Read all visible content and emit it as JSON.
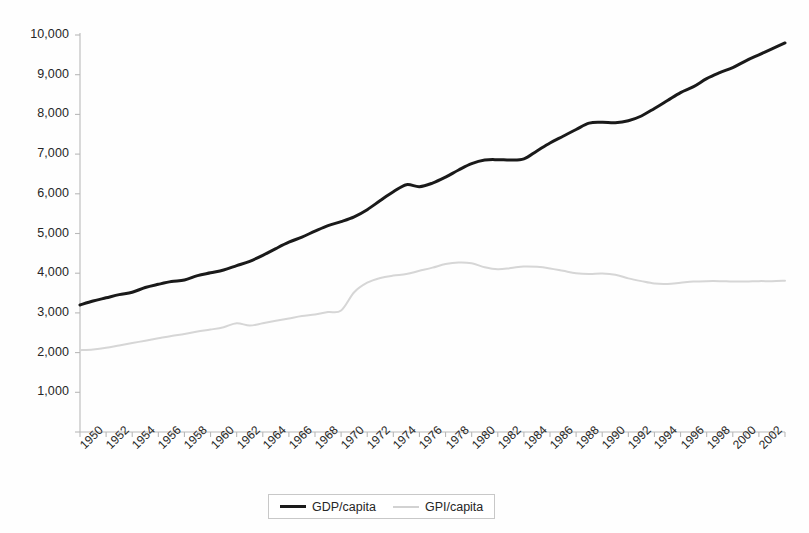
{
  "chart_data": {
    "type": "line",
    "title": "",
    "subtitle": "",
    "xlabel": "",
    "ylabel": "",
    "grid": false,
    "legend_position": "bottom",
    "xlim": [
      1950,
      2004
    ],
    "ylim": [
      0,
      10000
    ],
    "y_ticks": [
      1000,
      2000,
      3000,
      4000,
      5000,
      6000,
      7000,
      8000,
      9000,
      10000
    ],
    "y_tick_labels": [
      "1,000",
      "2,000",
      "3,000",
      "4,000",
      "5,000",
      "6,000",
      "7,000",
      "8,000",
      "9,000",
      "10,000"
    ],
    "x_ticks": [
      1950,
      1952,
      1954,
      1956,
      1958,
      1960,
      1962,
      1964,
      1966,
      1968,
      1970,
      1972,
      1974,
      1976,
      1978,
      1980,
      1982,
      1984,
      1986,
      1988,
      1990,
      1992,
      1994,
      1996,
      1998,
      2000,
      2002
    ],
    "x_tick_labels": [
      "1950",
      "1952",
      "1954",
      "1956",
      "1958",
      "1960",
      "1962",
      "1964",
      "1966",
      "1968",
      "1970",
      "1972",
      "1974",
      "1976",
      "1978",
      "1980",
      "1982",
      "1984",
      "1986",
      "1988",
      "1990",
      "1992",
      "1994",
      "1996",
      "1998",
      "2000",
      "2002"
    ],
    "x": [
      1950,
      1951,
      1952,
      1953,
      1954,
      1955,
      1956,
      1957,
      1958,
      1959,
      1960,
      1961,
      1962,
      1963,
      1964,
      1965,
      1966,
      1967,
      1968,
      1969,
      1970,
      1971,
      1972,
      1973,
      1974,
      1975,
      1976,
      1977,
      1978,
      1979,
      1980,
      1981,
      1982,
      1983,
      1984,
      1985,
      1986,
      1987,
      1988,
      1989,
      1990,
      1991,
      1992,
      1993,
      1994,
      1995,
      1996,
      1997,
      1998,
      1999,
      2000,
      2001,
      2002,
      2003,
      2004
    ],
    "series": [
      {
        "name": "GDP/capita",
        "color": "#1a1a1a",
        "width": 3.0,
        "values": [
          3200,
          3300,
          3380,
          3460,
          3520,
          3640,
          3720,
          3790,
          3830,
          3940,
          4010,
          4080,
          4190,
          4300,
          4450,
          4620,
          4780,
          4910,
          5060,
          5200,
          5300,
          5420,
          5600,
          5830,
          6050,
          6230,
          6180,
          6270,
          6420,
          6600,
          6760,
          6850,
          6860,
          6850,
          6880,
          7080,
          7280,
          7450,
          7620,
          7780,
          7800,
          7790,
          7840,
          7960,
          8150,
          8350,
          8550,
          8700,
          8900,
          9050,
          9180,
          9350,
          9500,
          9650,
          9800
        ]
      },
      {
        "name": "GPI/capita",
        "color": "#d6d6d6",
        "width": 2.0,
        "values": [
          2060,
          2080,
          2120,
          2180,
          2240,
          2300,
          2360,
          2420,
          2470,
          2530,
          2580,
          2640,
          2740,
          2680,
          2740,
          2800,
          2860,
          2920,
          2960,
          3020,
          3060,
          3520,
          3760,
          3880,
          3940,
          3980,
          4060,
          4140,
          4230,
          4270,
          4250,
          4150,
          4100,
          4130,
          4170,
          4160,
          4120,
          4060,
          4000,
          3980,
          3990,
          3960,
          3870,
          3800,
          3740,
          3730,
          3760,
          3790,
          3800,
          3800,
          3790,
          3790,
          3800,
          3800,
          3810
        ]
      }
    ]
  },
  "legend": {
    "entries": [
      {
        "label": "GDP/capita"
      },
      {
        "label": "GPI/capita"
      }
    ]
  },
  "axes": {
    "axis_color": "#b9b9b9",
    "tick_color": "#b9b9b9",
    "label_color": "#262626",
    "background": "#fefefe"
  }
}
